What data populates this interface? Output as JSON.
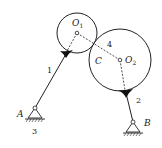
{
  "diagram": {
    "type": "mechanism",
    "labels": {
      "O1": "O",
      "O1_sub": "1",
      "O2": "O",
      "O2_sub": "2",
      "C": "C",
      "A": "A",
      "B": "B",
      "link1": "1",
      "link2": "2",
      "link3": "3",
      "link4": "4"
    },
    "colors": {
      "stroke": "#222222",
      "background": "#ffffff"
    },
    "geometry": {
      "circle1": {
        "cx": 77,
        "cy": 33,
        "r": 20
      },
      "circle2": {
        "cx": 120,
        "cy": 60,
        "r": 31
      },
      "pivotA": {
        "x": 35,
        "y": 108
      },
      "pivotB": {
        "x": 133,
        "y": 122
      },
      "joint1": {
        "x": 66,
        "y": 53
      },
      "joint2": {
        "x": 126,
        "y": 93
      }
    }
  }
}
